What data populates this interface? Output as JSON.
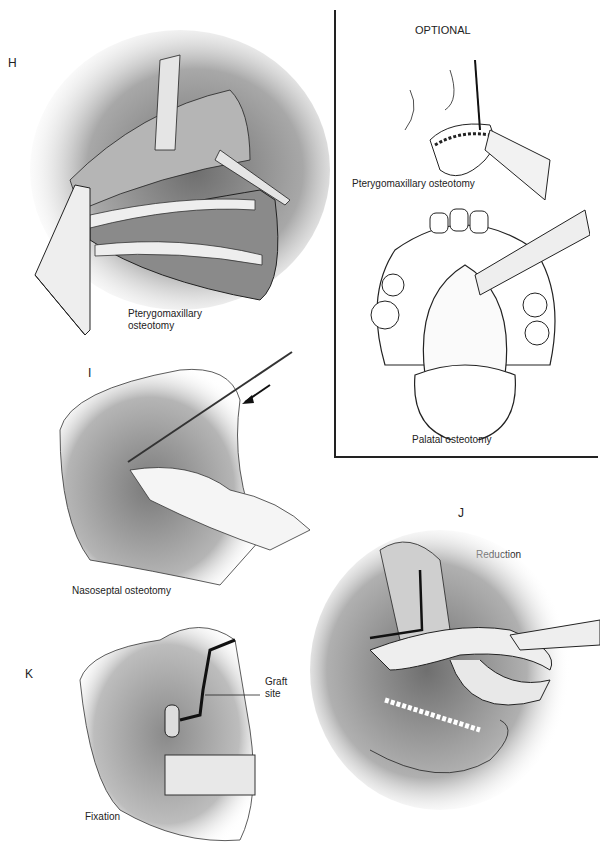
{
  "figure": {
    "panels": {
      "H": {
        "letter": "H",
        "caption_line1": "Pterygomaxillary",
        "caption_line2": "osteotomy"
      },
      "optional": {
        "title": "OPTIONAL",
        "caption_top": "Pterygomaxillary osteotomy",
        "caption_bottom": "Palatal osteotomy"
      },
      "I": {
        "letter": "I",
        "caption": "Nasoseptal osteotomy"
      },
      "J": {
        "letter": "J",
        "caption": "Reduction"
      },
      "K": {
        "letter": "K",
        "callout_line1": "Graft",
        "callout_line2": "site",
        "caption": "Fixation"
      }
    }
  }
}
